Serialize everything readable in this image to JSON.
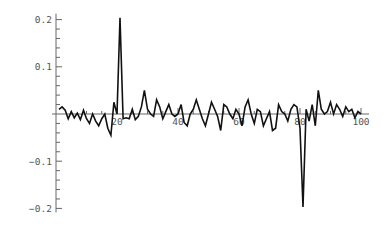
{
  "chart_data": {
    "type": "line",
    "title": "",
    "xlabel": "",
    "ylabel": "",
    "xlim": [
      0,
      100
    ],
    "ylim": [
      -0.2,
      0.2
    ],
    "grid": false,
    "legend": null,
    "x_ticks": [
      20,
      40,
      60,
      80,
      100
    ],
    "x_tick_labels": [
      "20",
      "40",
      "60",
      "80",
      "100"
    ],
    "y_ticks": [
      -0.2,
      -0.1,
      0.1,
      0.2
    ],
    "y_tick_labels": [
      "-0.2",
      "-0.1",
      "0.1",
      "0.2"
    ],
    "y_minor_step": 0.02,
    "line_color": "#111111",
    "axis_color": "#666666",
    "series": [
      {
        "name": "signal",
        "x": [
          1,
          2,
          3,
          4,
          5,
          6,
          7,
          8,
          9,
          10,
          11,
          12,
          13,
          14,
          15,
          16,
          17,
          18,
          19,
          20,
          21,
          22,
          23,
          24,
          25,
          26,
          27,
          28,
          29,
          30,
          31,
          32,
          33,
          34,
          35,
          36,
          37,
          38,
          39,
          40,
          41,
          42,
          43,
          44,
          45,
          46,
          47,
          48,
          49,
          50,
          51,
          52,
          53,
          54,
          55,
          56,
          57,
          58,
          59,
          60,
          61,
          62,
          63,
          64,
          65,
          66,
          67,
          68,
          69,
          70,
          71,
          72,
          73,
          74,
          75,
          76,
          77,
          78,
          79,
          80,
          81,
          82,
          83,
          84,
          85,
          86,
          87,
          88,
          89,
          90,
          91,
          92,
          93,
          94,
          95,
          96,
          97,
          98,
          99,
          100
        ],
        "values": [
          0.01,
          0.015,
          0.008,
          -0.01,
          0.005,
          -0.008,
          0.002,
          -0.012,
          0.008,
          -0.01,
          -0.02,
          0.0,
          -0.015,
          -0.025,
          -0.01,
          0.0,
          -0.03,
          -0.045,
          0.025,
          0.0,
          0.204,
          -0.01,
          -0.008,
          -0.01,
          0.01,
          -0.012,
          -0.005,
          0.015,
          0.05,
          0.01,
          0.0,
          -0.005,
          0.03,
          0.015,
          -0.01,
          0.005,
          0.02,
          0.0,
          -0.005,
          0.0,
          0.02,
          -0.018,
          -0.025,
          0.0,
          0.01,
          0.03,
          0.01,
          -0.01,
          -0.025,
          0.0,
          0.025,
          0.01,
          -0.005,
          -0.035,
          0.02,
          0.015,
          0.0,
          -0.01,
          0.01,
          0.0,
          -0.025,
          0.015,
          0.03,
          0.0,
          -0.02,
          0.01,
          0.005,
          -0.025,
          -0.01,
          0.005,
          -0.035,
          -0.03,
          0.02,
          0.005,
          0.0,
          -0.015,
          0.01,
          0.02,
          0.015,
          -0.03,
          -0.197,
          0.01,
          -0.015,
          0.02,
          -0.025,
          0.05,
          0.01,
          0.0,
          0.005,
          0.025,
          0.0,
          0.02,
          0.01,
          -0.005,
          0.015,
          0.005,
          0.01,
          -0.008,
          0.005,
          0.0
        ]
      }
    ]
  }
}
